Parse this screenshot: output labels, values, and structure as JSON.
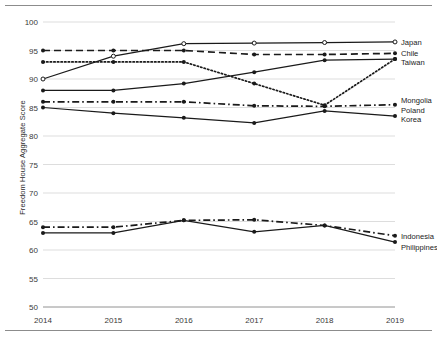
{
  "chart_data": {
    "type": "line",
    "title": "",
    "xlabel": "",
    "ylabel": "Freedom House Aggregate Score",
    "x": [
      2014,
      2015,
      2016,
      2017,
      2018,
      2019
    ],
    "xticklabels": [
      "2014",
      "2015",
      "2016",
      "2017",
      "2018",
      "2019"
    ],
    "ylim": [
      50,
      100
    ],
    "yticks": [
      50,
      55,
      60,
      65,
      70,
      75,
      80,
      85,
      90,
      95,
      100
    ],
    "yticklabels": [
      "50",
      "55",
      "60",
      "65",
      "70",
      "75",
      "80",
      "85",
      "90",
      "95",
      "100"
    ],
    "grid": "horizontal",
    "legend_position": "right-inline",
    "series": [
      {
        "name": "Japan",
        "values": [
          90,
          94,
          96.2,
          96.3,
          96.4,
          96.5
        ],
        "linestyle": "solid",
        "marker": "open-circle",
        "color": "#1a1a1a"
      },
      {
        "name": "Chile",
        "values": [
          95,
          95,
          95,
          94.3,
          94.3,
          94.5
        ],
        "linestyle": "dashed",
        "marker": "filled-circle",
        "color": "#1a1a1a"
      },
      {
        "name": "Taiwan",
        "values": [
          93,
          93,
          93,
          89.2,
          85.4,
          93.5
        ],
        "linestyle": "dotted",
        "marker": "filled-circle",
        "color": "#1a1a1a"
      },
      {
        "name": "Mongolia",
        "values": [
          86,
          86,
          86,
          85.3,
          85.2,
          85.5
        ],
        "linestyle": "dash-dot",
        "marker": "filled-circle",
        "color": "#1a1a1a"
      },
      {
        "name": "Poland",
        "values": [
          88,
          88,
          89.2,
          91.2,
          93.3,
          93.5
        ],
        "linestyle": "solid",
        "marker": "filled-circle",
        "color": "#1a1a1a"
      },
      {
        "name": "Korea",
        "values": [
          85,
          84,
          83.2,
          82.3,
          84.4,
          83.5
        ],
        "linestyle": "solid",
        "marker": "filled-circle",
        "color": "#1a1a1a"
      },
      {
        "name": "Indonesia",
        "values": [
          64,
          64,
          65.2,
          65.3,
          64.3,
          62.5
        ],
        "linestyle": "dash-dot",
        "marker": "filled-circle",
        "color": "#1a1a1a"
      },
      {
        "name": "Philippines",
        "values": [
          63,
          63,
          65.2,
          63.2,
          64.3,
          61.4
        ],
        "linestyle": "solid",
        "marker": "filled-circle",
        "color": "#1a1a1a"
      }
    ],
    "legend_entries": [
      {
        "label": "Japan",
        "y_value": 96.5
      },
      {
        "label": "Chile",
        "y_value": 94.5
      },
      {
        "label": "Taiwan",
        "y_value": 93.0
      },
      {
        "label": "Mongolia",
        "y_value": 86.3
      },
      {
        "label": "Poland",
        "y_value": 84.6
      },
      {
        "label": "Korea",
        "y_value": 83.0
      },
      {
        "label": "Indonesia",
        "y_value": 62.5
      },
      {
        "label": "Philippines",
        "y_value": 60.6
      }
    ]
  }
}
